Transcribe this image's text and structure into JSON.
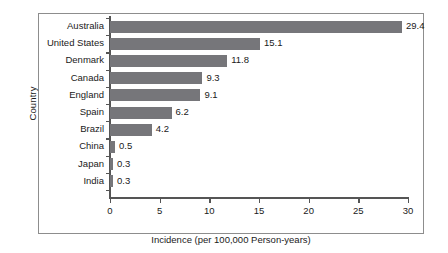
{
  "chart_data": {
    "type": "bar",
    "orientation": "horizontal",
    "title": "",
    "xlabel": "Incidence (per 100,000 Person-years)",
    "ylabel": "Country",
    "categories": [
      "Australia",
      "United States",
      "Denmark",
      "Canada",
      "England",
      "Spain",
      "Brazil",
      "China",
      "Japan",
      "India"
    ],
    "values": [
      29.4,
      15.1,
      11.8,
      9.3,
      9.1,
      6.2,
      4.2,
      0.5,
      0.3,
      0.3
    ],
    "value_labels": [
      "29.4",
      "15.1",
      "11.8",
      "9.3",
      "9.1",
      "6.2",
      "4.2",
      "0.5",
      "0.3",
      "0.3"
    ],
    "xlim": [
      0,
      30
    ],
    "xticks": [
      0,
      5,
      10,
      15,
      20,
      25,
      30
    ],
    "xtick_labels": [
      "0",
      "5",
      "10",
      "15",
      "20",
      "25",
      "30"
    ],
    "grid": false,
    "legend": null,
    "bar_color": "#76767a",
    "axis_color": "#555555",
    "frame_color": "#8d8d8d",
    "background": "#ffffff",
    "text_color": "#1a1a1a"
  }
}
